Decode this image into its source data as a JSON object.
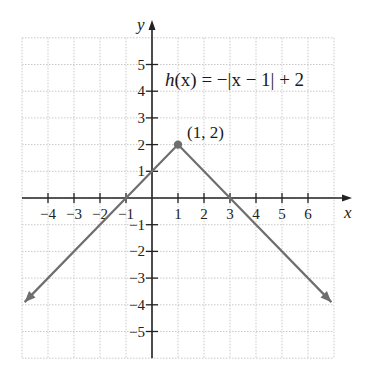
{
  "chart_data": {
    "type": "line",
    "title": "",
    "equation": "h(x) = −|x − 1| + 2",
    "xlabel": "x",
    "ylabel": "y",
    "xlim": [
      -5,
      7
    ],
    "ylim": [
      -6,
      6
    ],
    "grid": true,
    "x_ticks": [
      -4,
      -3,
      -2,
      -1,
      1,
      2,
      3,
      4,
      5,
      6
    ],
    "y_ticks": [
      -5,
      -4,
      -3,
      -2,
      -1,
      1,
      2,
      3,
      4,
      5
    ],
    "series": [
      {
        "name": "h(x) = -|x - 1| + 2",
        "color": "#6e6e6e",
        "x": [
          -4.9,
          -1,
          1,
          3,
          6.9
        ],
        "y": [
          -3.9,
          0,
          2,
          0,
          -3.9
        ],
        "arrows": "both ends"
      }
    ],
    "annotations": [
      {
        "text": "(1, 2)",
        "x": 1,
        "y": 2,
        "marker": "dot"
      },
      {
        "text": "h(x) = −|x − 1| + 2",
        "x": 2.5,
        "y": 4.5
      }
    ]
  },
  "labels": {
    "x_axis": "x",
    "y_axis": "y",
    "vertex": "(1, 2)",
    "eq_h": "h",
    "eq_rest": "(x) = −|x − 1| + 2"
  }
}
